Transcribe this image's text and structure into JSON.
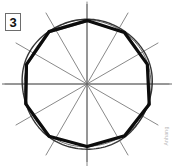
{
  "figure": {
    "label": "3",
    "watermark": "Anhang",
    "caption": "",
    "colors": {
      "polygon_stroke": "#0d0d0d",
      "circle_stroke": "#2b2b2b",
      "spoke_stroke": "#6b6b6b",
      "background": "#ffffff",
      "label_border": "#6d6d6d",
      "label_text": "#111111",
      "watermark_text": "#b9b9b9"
    }
  },
  "chart_data": {
    "type": "diagram",
    "title": "",
    "center": {
      "x": 87,
      "y": 84
    },
    "circle": {
      "radius": 65,
      "stroke_width": 1.4,
      "note": "freehand double-traced outer circle"
    },
    "polygon": {
      "sides": 10,
      "circumradius": 64,
      "start_angle_deg": 90,
      "step_deg": 36,
      "stroke_width": 3.2,
      "vertices_deg": [
        90,
        126,
        162,
        198,
        234,
        270,
        306,
        342,
        18,
        54
      ]
    },
    "spokes": {
      "count": 12,
      "step_deg": 30,
      "inner_radius": 0,
      "outer_radius": 82,
      "stroke_width": 0.8,
      "angles_deg": [
        0,
        30,
        60,
        90,
        120,
        150,
        180,
        210,
        240,
        270,
        300,
        330
      ]
    },
    "axis_lines": {
      "horizontal": {
        "y": 84,
        "x1": 2,
        "x2": 172
      },
      "vertical": {
        "x": 87,
        "y1": 4,
        "y2": 162
      }
    }
  }
}
